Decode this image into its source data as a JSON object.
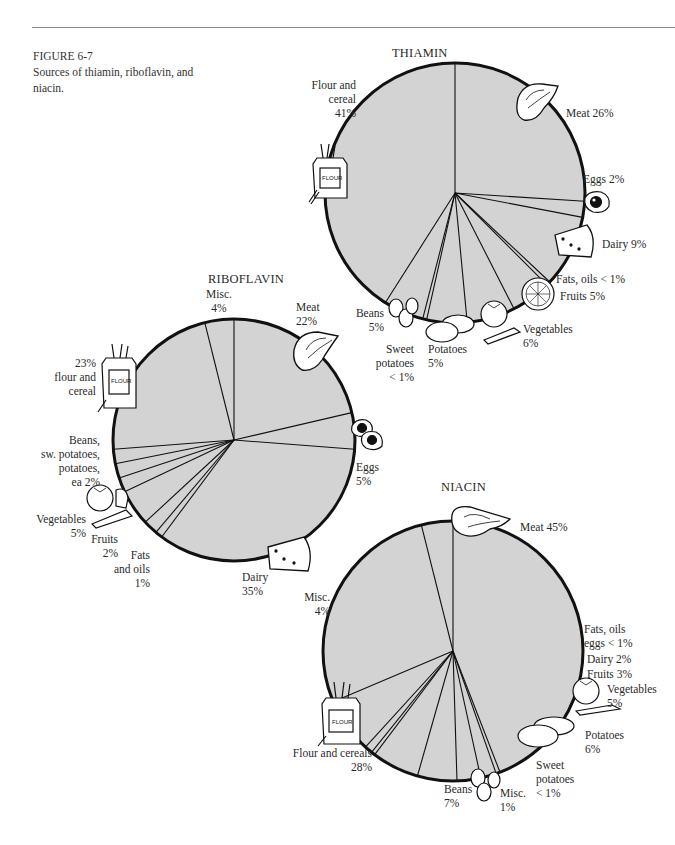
{
  "figure": {
    "number": "FIGURE 6-7",
    "caption": "Sources of thiamin, riboflavin, and niacin."
  },
  "style": {
    "pie_fill": "#d3d3d3",
    "pie_stroke": "#111111",
    "background": "#ffffff"
  },
  "chart_data": [
    {
      "type": "pie",
      "title": "THIAMIN",
      "start_angle_deg": 0,
      "direction": "clockwise",
      "categories": [
        "Meat",
        "Eggs",
        "Dairy",
        "Fats, oils",
        "Fruits",
        "Vegetables",
        "Potatoes",
        "Sweet potatoes",
        "Beans",
        "Flour and cereal"
      ],
      "values": [
        26,
        2,
        9,
        0.5,
        5,
        6,
        5,
        0.5,
        5,
        41
      ],
      "value_labels": [
        "26%",
        "2%",
        "9%",
        "< 1%",
        "5%",
        "6%",
        "5%",
        "< 1%",
        "5%",
        "41%"
      ]
    },
    {
      "type": "pie",
      "title": "RIBOFLAVIN",
      "start_angle_deg": 0,
      "direction": "clockwise",
      "categories": [
        "Meat",
        "Eggs",
        "Dairy",
        "Fats and oils",
        "Fruits",
        "Vegetables",
        "Potatoes",
        "Sweet potatoes",
        "Beans",
        "Flour and cereal",
        "Misc."
      ],
      "values": [
        22,
        5,
        35,
        1,
        2,
        5,
        2,
        2,
        2,
        23,
        4
      ],
      "value_labels": [
        "22%",
        "5%",
        "35%",
        "1%",
        "2%",
        "5%",
        "2%",
        "2%",
        "2%",
        "23%",
        "4%"
      ]
    },
    {
      "type": "pie",
      "title": "NIACIN",
      "start_angle_deg": 0,
      "direction": "clockwise",
      "categories": [
        "Meat",
        "Fats, oils, eggs",
        "Dairy",
        "Fruits",
        "Vegetables",
        "Potatoes",
        "Sweet potatoes",
        "Misc. (1%)",
        "Beans",
        "Flour and cereals",
        "Misc. (4%)"
      ],
      "values": [
        45,
        0.5,
        2,
        3,
        5,
        6,
        0.5,
        1,
        7,
        28,
        4
      ],
      "value_labels": [
        "45%",
        "< 1%",
        "2%",
        "3%",
        "5%",
        "6%",
        "< 1%",
        "1%",
        "7%",
        "28%",
        "4%"
      ]
    }
  ],
  "thiamin": {
    "title": "THIAMIN",
    "labels": {
      "flour": [
        "Flour and",
        "cereal",
        "41%"
      ],
      "meat": "Meat 26%",
      "eggs": "Eggs 2%",
      "dairy": "Dairy 9%",
      "fats": "Fats, oils < 1%",
      "fruits": "Fruits 5%",
      "vegetables": [
        "Vegetables",
        "6%"
      ],
      "potatoes": [
        "Potatoes",
        "5%"
      ],
      "sweet_potatoes": [
        "Sweet",
        "potatoes",
        "< 1%"
      ],
      "beans": [
        "Beans",
        "5%"
      ]
    }
  },
  "riboflavin": {
    "title": "RIBOFLAVIN",
    "labels": {
      "misc": [
        "Misc.",
        "4%"
      ],
      "meat": [
        "Meat",
        "22%"
      ],
      "flour": [
        "23%",
        "flour and",
        "cereal"
      ],
      "grouped": [
        "Beans,",
        "sw. potatoes,",
        "potatoes,",
        "ea 2%"
      ],
      "vegetables": [
        "Vegetables",
        "5%"
      ],
      "fruits": [
        "Fruits",
        "2%"
      ],
      "fats": [
        "Fats",
        "and oils",
        "1%"
      ],
      "dairy": [
        "Dairy",
        "35%"
      ],
      "eggs": [
        "Eggs",
        "5%"
      ]
    }
  },
  "niacin": {
    "title": "NIACIN",
    "labels": {
      "meat": "Meat 45%",
      "misc4": [
        "Misc.",
        "4%"
      ],
      "fats": [
        "Fats, oils",
        "eggs < 1%"
      ],
      "dairy": "Dairy 2%",
      "fruits": "Fruits 3%",
      "vegetables": [
        "Vegetables",
        "5%"
      ],
      "potatoes": [
        "Potatoes",
        "6%"
      ],
      "sweet_potatoes": [
        "Sweet",
        "potatoes",
        "< 1%"
      ],
      "misc1": [
        "Misc.",
        "1%"
      ],
      "beans": [
        "Beans",
        "7%"
      ],
      "flour": [
        "Flour and cereals",
        "28%"
      ]
    }
  },
  "icons": {
    "meat": "steak-icon",
    "eggs": "fried-egg-icon",
    "dairy": "cheese-wedge-icon",
    "fruits": "citrus-slice-icon",
    "vegetables": "tomato-carrot-icon",
    "potatoes": "potato-icon",
    "beans": "beans-icon",
    "flour": "flour-bag-icon"
  }
}
